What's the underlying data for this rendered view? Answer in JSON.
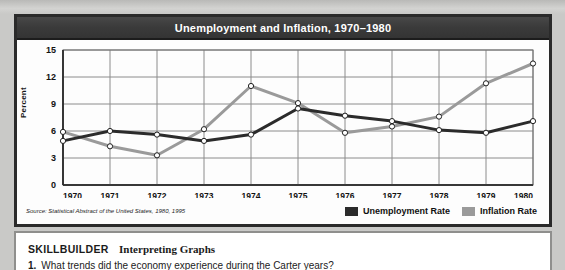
{
  "chart_data": {
    "type": "line",
    "title": "Unemployment and Inflation, 1970–1980",
    "xlabel": "",
    "ylabel": "Percent",
    "ylim": [
      0,
      15
    ],
    "yticks": [
      "0",
      "3",
      "6",
      "9",
      "12",
      "15"
    ],
    "grid": true,
    "legend_position": "bottom-right",
    "categories": [
      "1970",
      "1971",
      "1972",
      "1973",
      "1974",
      "1975",
      "1976",
      "1977",
      "1978",
      "1979",
      "1980"
    ],
    "series": [
      {
        "name": "Unemployment Rate",
        "color": "#2b2b2b",
        "values": [
          4.9,
          6.0,
          5.6,
          4.9,
          5.6,
          8.5,
          7.7,
          7.1,
          6.1,
          5.8,
          7.1
        ]
      },
      {
        "name": "Inflation Rate",
        "color": "#9a9a9a",
        "values": [
          5.9,
          4.3,
          3.3,
          6.2,
          11.0,
          9.1,
          5.8,
          6.5,
          7.6,
          11.3,
          13.5
        ]
      }
    ],
    "source": "Source: Statistical Abstract of the United States, 1980, 1995"
  },
  "skillbuilder": {
    "label": "SKILLBUILDER",
    "topic": "Interpreting Graphs",
    "question_number": "1.",
    "question_text": "What trends did the economy experience during the Carter years?"
  }
}
